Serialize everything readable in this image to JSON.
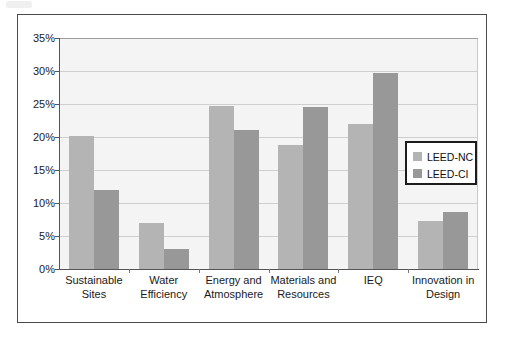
{
  "chart_data": {
    "type": "bar",
    "title": "",
    "subtitle": "",
    "xlabel": "",
    "ylabel": "",
    "ylim": [
      0,
      35
    ],
    "y_tick_labels": [
      "0%",
      "5%",
      "10%",
      "15%",
      "20%",
      "25%",
      "30%",
      "35%"
    ],
    "y_tick_values": [
      0,
      5,
      10,
      15,
      20,
      25,
      30,
      35
    ],
    "grid": true,
    "legend_position": "inside-right",
    "categories": [
      "Sustainable Sites",
      "Water Efficiency",
      "Energy and Atmosphere",
      "Materials and Resources",
      "IEQ",
      "Innovation in Design"
    ],
    "category_lines": [
      [
        "Sustainable",
        "Sites"
      ],
      [
        "Water",
        "Efficiency"
      ],
      [
        "Energy and",
        "Atmosphere"
      ],
      [
        "Materials and",
        "Resources"
      ],
      [
        "IEQ",
        ""
      ],
      [
        "Innovation in",
        "Design"
      ]
    ],
    "series": [
      {
        "name": "LEED-NC",
        "color": "#b4b4b4",
        "values": [
          20.1,
          7.0,
          24.7,
          18.8,
          22.0,
          7.2
        ]
      },
      {
        "name": "LEED-CI",
        "color": "#989898",
        "values": [
          12.0,
          3.0,
          21.0,
          24.5,
          29.7,
          8.7
        ]
      }
    ]
  },
  "legend": {
    "entries": [
      {
        "label": "LEED-NC",
        "swatch": "series-nc"
      },
      {
        "label": "LEED-CI",
        "swatch": "series-ci"
      }
    ]
  },
  "colors": {
    "series_nc": "#b4b4b4",
    "series_ci": "#989898",
    "plot_background": "#f4f4f4",
    "gridline": "#cfcfcf",
    "axis": "#555555",
    "frame_border": "#4a4a4a",
    "legend_border": "#1c1c1c",
    "text": "#1a1a1a"
  }
}
